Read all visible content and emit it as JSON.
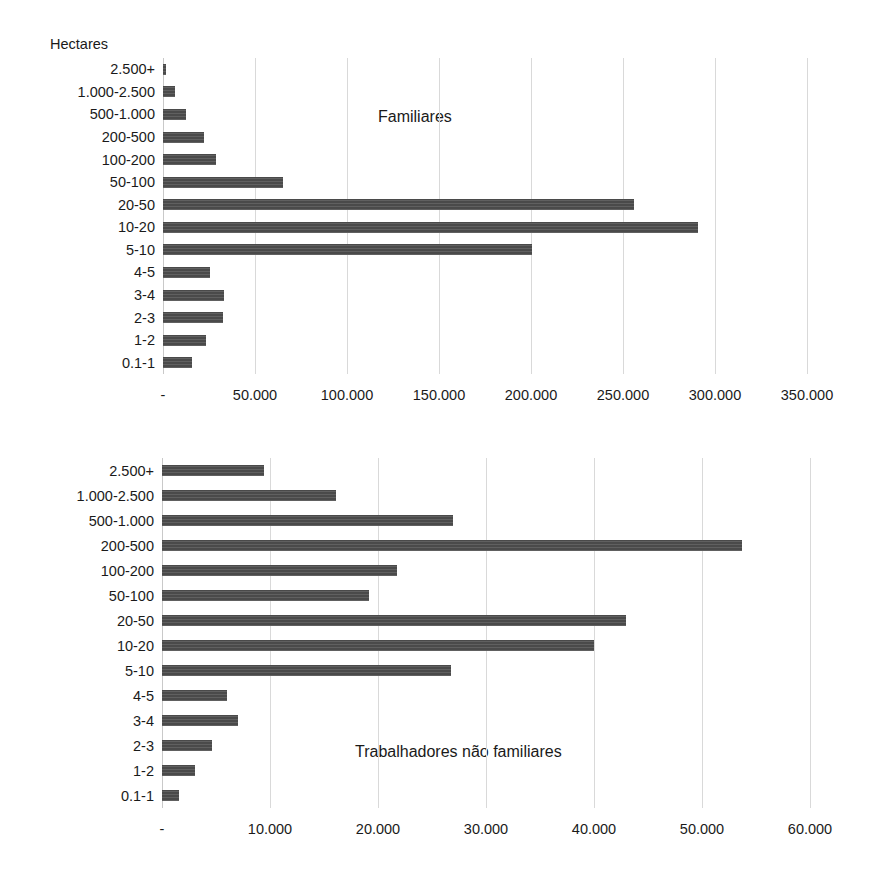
{
  "labels": {
    "hectares": "Hectares"
  },
  "chart_data": [
    {
      "type": "bar",
      "orientation": "horizontal",
      "title": "Familiares",
      "title_position": "inside-plot",
      "xlabel": "",
      "ylabel": "Hectares",
      "grid": true,
      "legend": "none",
      "xlim": [
        0,
        350000
      ],
      "xticks": [
        0,
        50000,
        100000,
        150000,
        200000,
        250000,
        300000,
        350000
      ],
      "xticklabels": [
        "-",
        "50.000",
        "100.000",
        "150.000",
        "200.000",
        "250.000",
        "300.000",
        "350.000"
      ],
      "categories": [
        "2.500+",
        "1.000-2.500",
        "500-1.000",
        "200-500",
        "100-200",
        "50-100",
        "20-50",
        "10-20",
        "5-10",
        "4-5",
        "3-4",
        "2-3",
        "1-2",
        "0.1-1"
      ],
      "values": [
        1800,
        6500,
        12500,
        22500,
        29000,
        65200,
        256000,
        291000,
        200500,
        25500,
        33000,
        32500,
        23500,
        15500
      ]
    },
    {
      "type": "bar",
      "orientation": "horizontal",
      "title": "Trabalhadores não familiares",
      "title_position": "inside-plot",
      "xlabel": "",
      "ylabel": "",
      "grid": true,
      "legend": "none",
      "xlim": [
        0,
        60000
      ],
      "xticks": [
        0,
        10000,
        20000,
        30000,
        40000,
        50000,
        60000
      ],
      "xticklabels": [
        "-",
        "10.000",
        "20.000",
        "30.000",
        "40.000",
        "50.000",
        "60.000"
      ],
      "categories": [
        "2.500+",
        "1.000-2.500",
        "500-1.000",
        "200-500",
        "100-200",
        "50-100",
        "20-50",
        "10-20",
        "5-10",
        "4-5",
        "3-4",
        "2-3",
        "1-2",
        "0.1-1"
      ],
      "values": [
        9400,
        16100,
        26900,
        53700,
        21800,
        19200,
        43000,
        40000,
        26800,
        6000,
        7000,
        4600,
        3100,
        1600
      ]
    }
  ],
  "colors": {
    "bar": "#4a4a4a",
    "gridline": "#d9d9d9",
    "text": "#1a1a1a",
    "background": "#ffffff"
  }
}
